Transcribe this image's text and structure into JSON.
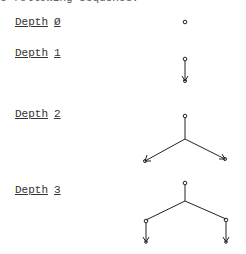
{
  "header_fragment": "e following sequence:",
  "rows": [
    {
      "label": "Depth",
      "number": "Ø"
    },
    {
      "label": "Depth",
      "number": "1"
    },
    {
      "label": "Depth",
      "number": "2"
    },
    {
      "label": "Depth",
      "number": "3"
    }
  ]
}
